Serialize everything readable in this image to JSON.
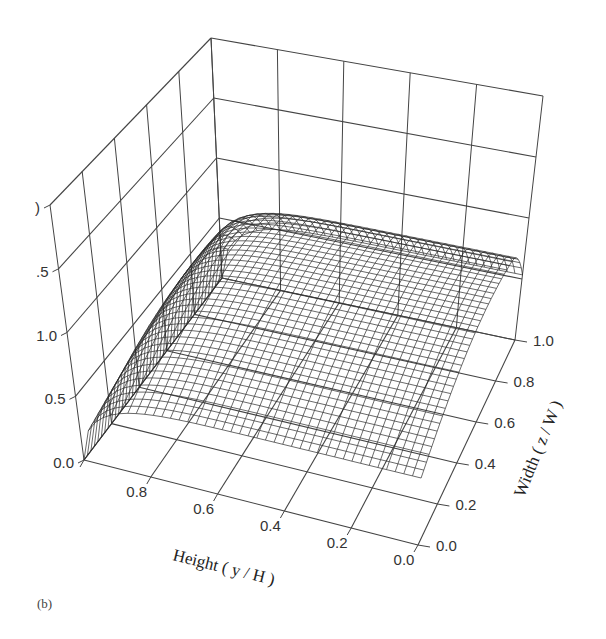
{
  "chart_data": {
    "type": "surface3d",
    "panel_label": "(b)",
    "title": "",
    "xlabel": "Height ( y / H )",
    "ylabel": "Width ( z / W )",
    "zlabel": "",
    "x_ticks": [
      "0.0",
      "0.2",
      "0.4",
      "0.6",
      "0.8"
    ],
    "y_ticks": [
      "0.0",
      "0.2",
      "0.4",
      "0.6",
      "0.8",
      "1.0"
    ],
    "z_ticks": [
      "0.0",
      "0.5",
      "1.0",
      ".5",
      ")"
    ],
    "xlim": [
      0,
      1
    ],
    "ylim": [
      0,
      1
    ],
    "zlim": [
      0,
      2
    ],
    "grid": true,
    "approx_surface_samples": {
      "y_over_H": [
        1.0,
        0.8,
        0.6,
        0.4,
        0.2,
        0.0
      ],
      "z_over_W": [
        0.0,
        0.2,
        0.4,
        0.6,
        0.8,
        1.0
      ],
      "values": [
        [
          0.0,
          0.0,
          0.0,
          0.0,
          0.0,
          0.0
        ],
        [
          0.45,
          0.55,
          0.62,
          0.66,
          0.64,
          0.55
        ],
        [
          0.5,
          0.64,
          0.74,
          0.8,
          0.78,
          0.66
        ],
        [
          0.52,
          0.68,
          0.8,
          0.86,
          0.84,
          0.72
        ],
        [
          0.53,
          0.7,
          0.83,
          0.9,
          0.88,
          0.75
        ],
        [
          0.53,
          0.7,
          0.84,
          0.91,
          0.89,
          0.76
        ]
      ]
    }
  }
}
